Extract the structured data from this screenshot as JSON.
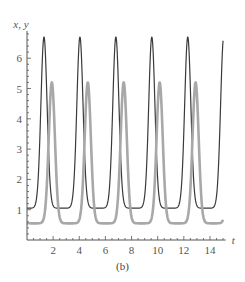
{
  "chart_data": {
    "type": "line",
    "title": "",
    "caption": "(b)",
    "xlabel": "t",
    "ylabel": "x, y",
    "xlim": [
      0,
      15.2
    ],
    "ylim": [
      0,
      6.9
    ],
    "x_ticks": [
      2,
      4,
      6,
      8,
      10,
      12,
      14
    ],
    "y_ticks": [
      1,
      2,
      3,
      4,
      5,
      6
    ],
    "grid": false,
    "legend": null,
    "series": [
      {
        "name": "x",
        "color": "#3a3a3a",
        "width": 1.2,
        "period": 2.75,
        "peak": 6.7,
        "trough": 1.05,
        "first_peak_t": 1.3,
        "start_value": 1.3,
        "end_value": 5.5,
        "peaks_t": [
          1.3,
          4.05,
          6.8,
          9.55,
          12.3
        ],
        "troughs_t": [
          2.6,
          5.35,
          8.1,
          10.85,
          13.6
        ]
      },
      {
        "name": "y",
        "color": "#a8a8a8",
        "width": 2.6,
        "period": 2.75,
        "peak": 5.2,
        "trough": 0.55,
        "first_peak_t": 1.9,
        "start_value": 0.85,
        "end_value": 0.8,
        "peaks_t": [
          1.9,
          4.65,
          7.4,
          10.15,
          12.9
        ],
        "troughs_t": [
          0.6,
          3.35,
          6.1,
          8.85,
          11.6,
          14.35
        ]
      }
    ]
  }
}
